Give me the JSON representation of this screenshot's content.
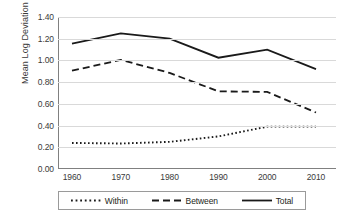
{
  "chart_data": {
    "type": "line",
    "title": "",
    "xlabel": "",
    "ylabel": "Mean Log Deviation",
    "x": [
      1960,
      1970,
      1980,
      1990,
      2000,
      2010
    ],
    "categories": [
      "1960",
      "1970",
      "1980",
      "1990",
      "2000",
      "2010"
    ],
    "xlim": [
      1960,
      2010
    ],
    "ylim": [
      0.0,
      1.4
    ],
    "ytick_labels": [
      "0.00",
      "0.20",
      "0.40",
      "0.60",
      "0.80",
      "1.00",
      "1.20",
      "1.40"
    ],
    "ytick_values": [
      0.0,
      0.2,
      0.4,
      0.6,
      0.8,
      1.0,
      1.2,
      1.4
    ],
    "grid": "horizontal",
    "legend_position": "bottom",
    "series": [
      {
        "name": "Within",
        "style": "dotted",
        "color": "#1a1a1a",
        "values": [
          0.24,
          0.235,
          0.25,
          0.3,
          0.39,
          0.39
        ]
      },
      {
        "name": "Between",
        "style": "dashed",
        "color": "#1a1a1a",
        "values": [
          0.905,
          1.005,
          0.885,
          0.715,
          0.71,
          0.52
        ]
      },
      {
        "name": "Total",
        "style": "solid",
        "color": "#1a1a1a",
        "values": [
          1.155,
          1.25,
          1.2,
          1.025,
          1.1,
          0.92
        ]
      }
    ]
  },
  "legend": {
    "items": [
      {
        "label": "Within"
      },
      {
        "label": "Between"
      },
      {
        "label": "Total"
      }
    ]
  }
}
